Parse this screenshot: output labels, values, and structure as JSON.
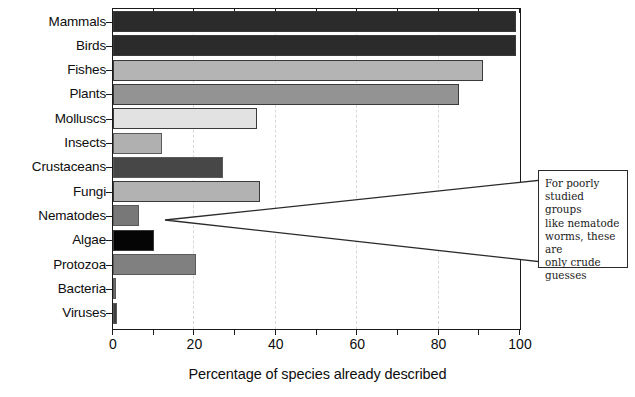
{
  "chart_data": {
    "type": "bar",
    "orientation": "horizontal",
    "title": "",
    "xlabel": "Percentage of species already described",
    "ylabel": "",
    "xlim": [
      0,
      100
    ],
    "xticks": [
      0,
      20,
      40,
      60,
      80,
      100
    ],
    "xtick_labels": [
      "0",
      "20",
      "40",
      "60",
      "80",
      "100"
    ],
    "minor_tick_interval": 10,
    "grid": "vertical-dashed",
    "legend": "none",
    "categories": [
      "Mammals",
      "Birds",
      "Fishes",
      "Plants",
      "Molluscs",
      "Insects",
      "Crustaceans",
      "Fungi",
      "Nematodes",
      "Algae",
      "Protozoa",
      "Bacteria",
      "Viruses"
    ],
    "values": [
      99,
      99,
      91,
      85,
      35.5,
      12,
      27,
      36,
      6.5,
      10,
      20.5,
      0.5,
      1
    ],
    "bar_colors": [
      "#2b2b2b",
      "#2b2b2b",
      "#b4b4b4",
      "#939393",
      "#e2e2e2",
      "#b0b0b0",
      "#474747",
      "#b2b2b2",
      "#787878",
      "#050505",
      "#808080",
      "#6d6d6d",
      "#3d3d3d"
    ],
    "annotations": [
      {
        "target_category": "Nematodes",
        "text": "For poorly studied groups like nematode worms, these are only crude guesses",
        "lines": [
          "For poorly",
          "studied groups",
          "like nematode",
          "worms, these are",
          "only crude",
          "guesses"
        ]
      }
    ]
  }
}
